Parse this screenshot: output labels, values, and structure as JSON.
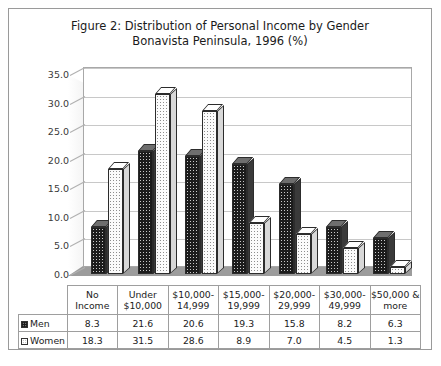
{
  "figure": {
    "title_line1": "Figure 2: Distribution of Personal Income by Gender",
    "title_line2": "Bonavista Peninsula, 1996 (%)"
  },
  "colors": {
    "men": "#1c1c1c",
    "women": "#fbfbfb",
    "frame": "#9a9a9a",
    "gridline": "#c8c8c8",
    "floor": "#9c9c9c"
  },
  "legend": {
    "men_label": "Men",
    "women_label": "Women"
  },
  "chart_data": {
    "type": "bar",
    "title": "Figure 2: Distribution of Personal Income by Gender Bonavista Peninsula, 1996 (%)",
    "xlabel": "",
    "ylabel": "",
    "ylim": [
      0,
      35
    ],
    "yticks": [
      "0.0",
      "5.0",
      "10.0",
      "15.0",
      "20.0",
      "25.0",
      "30.0",
      "35.0"
    ],
    "grid": true,
    "legend_position": "bottom-table",
    "categories": [
      "No Income",
      "Under $10,000",
      "$10,000-14,999",
      "$15,000-19,999",
      "$20,000-29,999",
      "$30,000-49,999",
      "$50,000 & more"
    ],
    "category_lines": [
      [
        "No Income",
        ""
      ],
      [
        "Under",
        "$10,000"
      ],
      [
        "$10,000-",
        "14,999"
      ],
      [
        "$15,000-",
        "19,999"
      ],
      [
        "$20,000-",
        "29,999"
      ],
      [
        "$30,000-",
        "49,999"
      ],
      [
        "$50,000 &",
        "more"
      ]
    ],
    "series": [
      {
        "name": "Men",
        "values": [
          8.3,
          21.6,
          20.6,
          19.3,
          15.8,
          8.2,
          6.3
        ]
      },
      {
        "name": "Women",
        "values": [
          18.3,
          31.5,
          28.6,
          8.9,
          7.0,
          4.5,
          1.3
        ]
      }
    ]
  }
}
